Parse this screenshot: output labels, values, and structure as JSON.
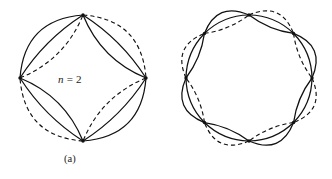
{
  "figure": {
    "background_color": "#ffffff",
    "stroke_color": "#111111",
    "panels": [
      {
        "id": "a",
        "caption": "(a)",
        "label_variable": "n",
        "label_equals": " = ",
        "label_value": "2",
        "label_full": "n = 2",
        "node_count": 4,
        "edges_per_pair": 3,
        "center": {
          "x": 83,
          "y": 78
        },
        "radius": 63,
        "node_angles_deg": [
          270,
          0,
          90,
          180
        ],
        "curve_styles": [
          "solid",
          "solid",
          "dashed"
        ]
      },
      {
        "id": "b",
        "caption": "(b)",
        "label_variable": "n",
        "label_equals": " = ",
        "label_value": "4",
        "label_full": "n = 4",
        "node_count": 8,
        "edges_per_pair": 3,
        "center": {
          "x": 83,
          "y": 78
        },
        "radius": 63,
        "node_angles_deg": [
          270,
          315,
          0,
          45,
          90,
          135,
          180,
          225
        ],
        "curve_styles": [
          "solid",
          "solid",
          "dashed"
        ]
      }
    ]
  },
  "chart_data": {
    "type": "diagram",
    "title": "",
    "panels": [
      {
        "label": "(a)",
        "annotation": "n = 2",
        "nodes": 4,
        "parallel_edges": 3,
        "dashed_circle": true
      },
      {
        "label": "(b)",
        "annotation": "n = 4",
        "nodes": 8,
        "parallel_edges": 3,
        "dashed_circle": true
      }
    ]
  }
}
